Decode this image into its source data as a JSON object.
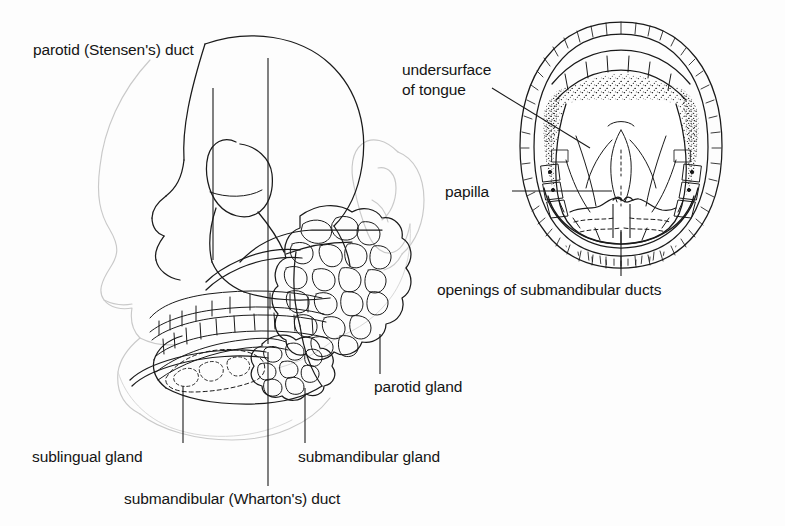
{
  "figure": {
    "background_color": "#fdfdfd",
    "ink_color": "#141414",
    "soft_tissue_color": "#cfcfcf"
  },
  "left_panel": {
    "name": "lateral-head-skull-view",
    "labels": {
      "parotid_duct": "parotid (Stensen's) duct",
      "parotid_gland": "parotid gland",
      "sublingual_gland": "sublingual gland",
      "submandibular_gland": "submandibular gland",
      "submandibular_duct": "submandibular (Wharton's) duct"
    }
  },
  "right_panel": {
    "name": "open-mouth-tongue-elevated-view",
    "labels": {
      "undersurface_of_tongue": "undersurface\nof tongue",
      "undersurface_line1": "undersurface",
      "undersurface_line2": "of tongue",
      "papilla": "papilla",
      "openings_of_submandibular_ducts": "openings of submandibular ducts"
    }
  }
}
